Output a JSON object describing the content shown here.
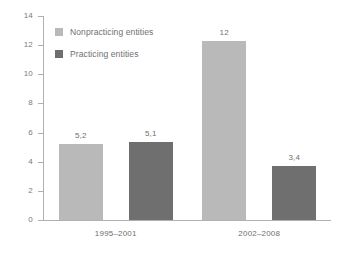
{
  "chart_data": {
    "type": "bar",
    "title": "",
    "subtitle": "",
    "xlabel": "",
    "ylabel": "",
    "ylim": [
      0,
      14
    ],
    "ytick_step": 2,
    "ytick_labels": [
      "0",
      "2",
      "4",
      "6",
      "8",
      "10",
      "12",
      "14"
    ],
    "grid": false,
    "legend_position": "top-left",
    "categories": [
      "1995–2001",
      "2002–2008"
    ],
    "series": [
      {
        "name": "Nonpracticing entities",
        "color": "#b9b9b9",
        "values": [
          5.2,
          12.3
        ],
        "labels": [
          "5,2",
          "12"
        ]
      },
      {
        "name": "Practicing entities",
        "color": "#6f6f6f",
        "values": [
          5.35,
          3.7
        ],
        "labels": [
          "5,1",
          "3,4"
        ]
      }
    ]
  },
  "legend": {
    "items": [
      {
        "label": "Nonpracticing entities",
        "color": "#b9b9b9"
      },
      {
        "label": "Practicing entities",
        "color": "#6f6f6f"
      }
    ]
  },
  "axis": {
    "color": "#b0b0b0",
    "text_color": "#7a7a7a"
  }
}
